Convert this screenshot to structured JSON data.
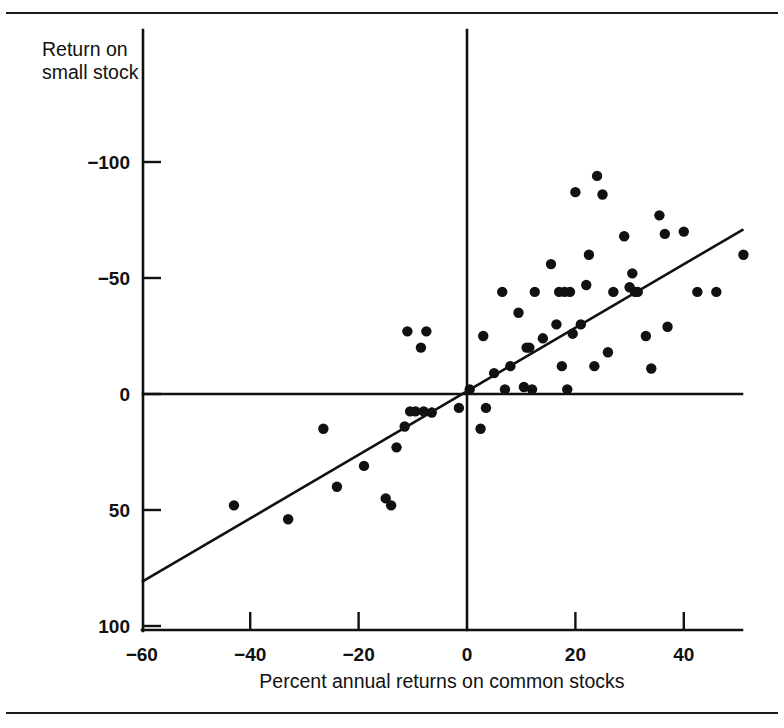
{
  "figure": {
    "background_color": "#ffffff",
    "ink_color": "#111111",
    "top_rule": "horizontal-rule",
    "bottom_rule": "horizontal-rule"
  },
  "axes": {
    "y_axis_title_line1": "Return on",
    "y_axis_title_line2": "small stock",
    "x_axis_title": "Percent annual returns on common stocks",
    "x_tick_labels": [
      "−60",
      "−40",
      "−20",
      "0",
      "20",
      "40"
    ],
    "y_tick_labels": [
      "100",
      "50",
      "0",
      "−50",
      "−100"
    ]
  },
  "chart_data": {
    "type": "scatter",
    "title": "",
    "xlabel": "Percent annual returns on common stocks",
    "ylabel": "Return on small stock",
    "xlim": [
      -60,
      52
    ],
    "ylim": [
      -100,
      120
    ],
    "xticks": [
      -60,
      -40,
      -20,
      0,
      20,
      40
    ],
    "yticks": [
      -100,
      -50,
      0,
      50,
      100
    ],
    "grid": false,
    "legend": null,
    "zero_lines": {
      "vertical_x": 0,
      "horizontal_y": 0
    },
    "trend_line": {
      "type": "least-squares-fit",
      "x_start": -60,
      "y_start": -81,
      "x_end": 51,
      "y_end": 71
    },
    "points": [
      {
        "x": -43.0,
        "y": -48.0
      },
      {
        "x": -33.0,
        "y": -54.0
      },
      {
        "x": -26.5,
        "y": -15.0
      },
      {
        "x": -24.0,
        "y": -40.0
      },
      {
        "x": -19.0,
        "y": -31.0
      },
      {
        "x": -15.0,
        "y": -45.0
      },
      {
        "x": -14.0,
        "y": -48.0
      },
      {
        "x": -13.0,
        "y": -23.0
      },
      {
        "x": -11.5,
        "y": -14.0
      },
      {
        "x": -11.0,
        "y": 27.0
      },
      {
        "x": -10.5,
        "y": -7.5
      },
      {
        "x": -9.5,
        "y": -7.5
      },
      {
        "x": -8.5,
        "y": 20.0
      },
      {
        "x": -8.0,
        "y": -7.5
      },
      {
        "x": -7.5,
        "y": 27.0
      },
      {
        "x": -6.5,
        "y": -8.0
      },
      {
        "x": -1.5,
        "y": -6.0
      },
      {
        "x": 0.5,
        "y": 2.0
      },
      {
        "x": 2.5,
        "y": -15.0
      },
      {
        "x": 3.0,
        "y": 25.0
      },
      {
        "x": 3.5,
        "y": -6.0
      },
      {
        "x": 5.0,
        "y": 9.0
      },
      {
        "x": 6.5,
        "y": 44.0
      },
      {
        "x": 7.0,
        "y": 2.0
      },
      {
        "x": 8.0,
        "y": 12.0
      },
      {
        "x": 9.5,
        "y": 35.0
      },
      {
        "x": 10.5,
        "y": 3.0
      },
      {
        "x": 11.0,
        "y": 20.0
      },
      {
        "x": 11.5,
        "y": 20.0
      },
      {
        "x": 12.0,
        "y": 2.0
      },
      {
        "x": 12.5,
        "y": 44.0
      },
      {
        "x": 14.0,
        "y": 24.0
      },
      {
        "x": 15.5,
        "y": 56.0
      },
      {
        "x": 16.5,
        "y": 30.0
      },
      {
        "x": 17.0,
        "y": 44.0
      },
      {
        "x": 17.5,
        "y": 12.0
      },
      {
        "x": 18.0,
        "y": 44.0
      },
      {
        "x": 18.5,
        "y": 2.0
      },
      {
        "x": 19.0,
        "y": 44.0
      },
      {
        "x": 19.5,
        "y": 26.0
      },
      {
        "x": 20.0,
        "y": 87.0
      },
      {
        "x": 21.0,
        "y": 30.0
      },
      {
        "x": 22.0,
        "y": 47.0
      },
      {
        "x": 22.5,
        "y": 60.0
      },
      {
        "x": 23.5,
        "y": 12.0
      },
      {
        "x": 24.0,
        "y": 94.0
      },
      {
        "x": 25.0,
        "y": 86.0
      },
      {
        "x": 26.0,
        "y": 18.0
      },
      {
        "x": 27.0,
        "y": 44.0
      },
      {
        "x": 29.0,
        "y": 68.0
      },
      {
        "x": 30.0,
        "y": 46.0
      },
      {
        "x": 30.5,
        "y": 52.0
      },
      {
        "x": 31.0,
        "y": 44.0
      },
      {
        "x": 31.5,
        "y": 44.0
      },
      {
        "x": 33.0,
        "y": 25.0
      },
      {
        "x": 34.0,
        "y": 11.0
      },
      {
        "x": 35.5,
        "y": 77.0
      },
      {
        "x": 36.5,
        "y": 69.0
      },
      {
        "x": 37.0,
        "y": 29.0
      },
      {
        "x": 40.0,
        "y": 70.0
      },
      {
        "x": 42.5,
        "y": 44.0
      },
      {
        "x": 46.0,
        "y": 44.0
      },
      {
        "x": 51.0,
        "y": 60.0
      }
    ]
  }
}
